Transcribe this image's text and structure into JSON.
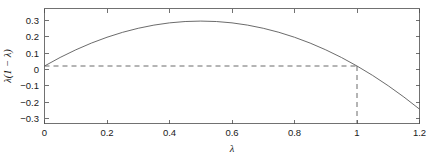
{
  "chart_data": {
    "type": "line",
    "title": "",
    "xlabel": "λ",
    "ylabel": "λ(1 − λ)",
    "xlim": [
      0,
      1.2
    ],
    "ylim": [
      -0.32,
      0.32
    ],
    "grid": false,
    "legend": null,
    "xticks": [
      0,
      0.2,
      0.4,
      0.6,
      0.8,
      1,
      1.2
    ],
    "xticklabels": [
      "0",
      "0.2",
      "0.4",
      "0.6",
      "0.8",
      "1",
      "1.2"
    ],
    "yticks": [
      0.3,
      0.2,
      0.1,
      0,
      -0.1,
      -0.2,
      -0.3
    ],
    "yticklabels": [
      "0.3",
      "0.2",
      "0.1",
      "0",
      "−0.1",
      "−0.2",
      "−0.3"
    ],
    "series": [
      {
        "name": "λ(1 − λ)",
        "style": "solid",
        "color": "#5a5a5a",
        "x": [
          0,
          0.05,
          0.1,
          0.15,
          0.2,
          0.25,
          0.3,
          0.35,
          0.4,
          0.45,
          0.5,
          0.55,
          0.6,
          0.65,
          0.7,
          0.75,
          0.8,
          0.85,
          0.9,
          0.95,
          1.0,
          1.05,
          1.1,
          1.15,
          1.2
        ],
        "y": [
          0,
          0.0475,
          0.09,
          0.1275,
          0.16,
          0.1875,
          0.21,
          0.2275,
          0.24,
          0.2475,
          0.25,
          0.2475,
          0.24,
          0.2275,
          0.21,
          0.1875,
          0.16,
          0.1275,
          0.09,
          0.0475,
          0,
          -0.0525,
          -0.11,
          -0.1725,
          -0.24
        ]
      }
    ],
    "annotations": [
      {
        "name": "zero-level-dashed-line",
        "style": "dashed",
        "color": "#5a5a5a",
        "x": [
          0,
          1.0
        ],
        "y": [
          0,
          0
        ]
      },
      {
        "name": "root-marker-dashed-line",
        "style": "dashed",
        "color": "#5a5a5a",
        "x": [
          1.0,
          1.0
        ],
        "y": [
          0,
          -0.32
        ]
      }
    ]
  },
  "figure": {
    "background_color": "#ffffff",
    "axis_color": "#4d4d4d",
    "curve_color": "#5a5a5a"
  }
}
